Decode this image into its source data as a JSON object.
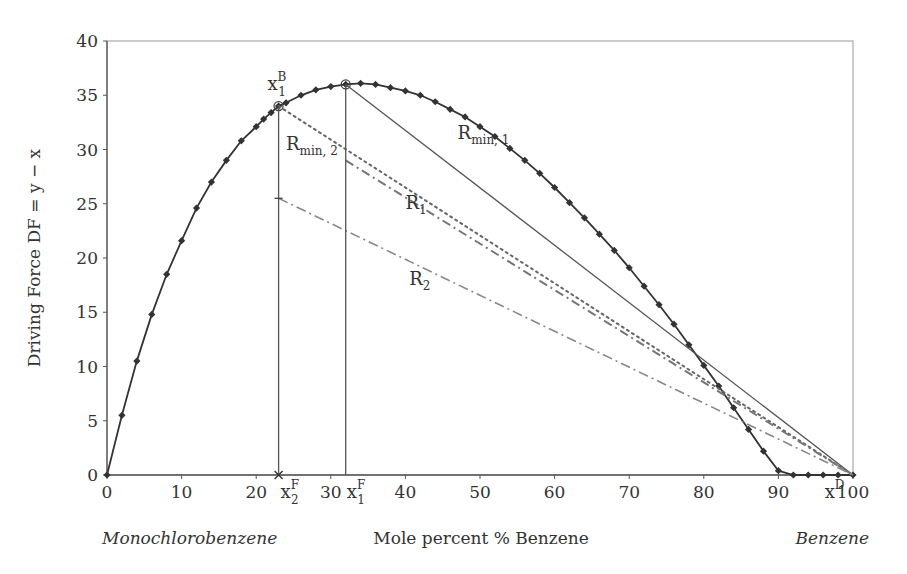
{
  "chart_data": {
    "type": "line",
    "title": "",
    "xlabel": "Mole percent % Benzene",
    "ylabel": "Driving Force DF = y − x",
    "xlim": [
      0,
      100
    ],
    "ylim": [
      0,
      40
    ],
    "x_ticks": [
      0,
      10,
      20,
      30,
      40,
      50,
      60,
      70,
      80,
      90,
      100
    ],
    "y_ticks": [
      0,
      5,
      10,
      15,
      20,
      25,
      30,
      35,
      40
    ],
    "grid": false,
    "legend": "none",
    "end_labels": {
      "left": "Monochlorobenzene",
      "right": "Benzene"
    },
    "series": [
      {
        "name": "Driving force curve",
        "style": "solid-with-diamond-markers",
        "x": [
          0,
          2,
          4,
          6,
          8,
          10,
          12,
          14,
          16,
          18,
          20,
          21,
          22,
          23,
          24,
          26,
          28,
          30,
          32,
          34,
          36,
          38,
          40,
          42,
          44,
          46,
          48,
          50,
          52,
          54,
          56,
          58,
          60,
          62,
          64,
          66,
          68,
          70,
          72,
          74,
          76,
          78,
          80,
          82,
          84,
          86,
          88,
          90,
          92,
          94,
          96,
          98,
          100
        ],
        "y": [
          0,
          5.5,
          10.5,
          14.8,
          18.5,
          21.6,
          24.6,
          27.0,
          29.0,
          30.8,
          32.1,
          32.8,
          33.4,
          34.0,
          34.3,
          35.0,
          35.5,
          35.8,
          36.0,
          36.1,
          36.0,
          35.7,
          35.4,
          35.0,
          34.4,
          33.7,
          33.0,
          32.1,
          31.2,
          30.1,
          29.0,
          27.8,
          26.5,
          25.1,
          23.7,
          22.2,
          20.7,
          19.1,
          17.4,
          15.7,
          13.9,
          12.0,
          10.1,
          8.2,
          6.2,
          4.2,
          2.2,
          0.4,
          0,
          0,
          0,
          0,
          0
        ]
      },
      {
        "name": "R_min,1",
        "style": "solid",
        "x": [
          32,
          100
        ],
        "y": [
          36.0,
          0
        ]
      },
      {
        "name": "R_min,2",
        "style": "dotted",
        "x": [
          23,
          100
        ],
        "y": [
          34.0,
          0
        ]
      },
      {
        "name": "R_1",
        "style": "dashed",
        "x": [
          32,
          100
        ],
        "y": [
          29.0,
          0
        ]
      },
      {
        "name": "R_2",
        "style": "dash-dot",
        "x": [
          23,
          100
        ],
        "y": [
          25.5,
          0
        ]
      },
      {
        "name": "x1F vertical",
        "style": "solid",
        "x": [
          32,
          32
        ],
        "y": [
          0,
          36.0
        ]
      },
      {
        "name": "x2F vertical",
        "style": "solid",
        "x": [
          23,
          23
        ],
        "y": [
          0,
          34.0
        ]
      }
    ],
    "annotations": [
      {
        "text": "x1B",
        "main": "x",
        "sup": "B",
        "sub": "1",
        "x": 21.5,
        "y": 35.5
      },
      {
        "text": "Rmin,2",
        "main": "R",
        "sub": "min, 2",
        "x": 24,
        "y": 30
      },
      {
        "text": "Rmin,1",
        "main": "R",
        "sub": "min, 1",
        "x": 47,
        "y": 31
      },
      {
        "text": "R1",
        "main": "R",
        "sub": "1",
        "x": 40,
        "y": 24.5
      },
      {
        "text": "R2",
        "main": "R",
        "sub": "2",
        "x": 40.5,
        "y": 17.5
      },
      {
        "text": "x2F",
        "main": "x",
        "sup": "F",
        "sub": "2",
        "x": 23,
        "y": -1.5
      },
      {
        "text": "x1F",
        "main": "x",
        "sup": "F",
        "sub": "1",
        "x": 32,
        "y": -1.5
      },
      {
        "text": "xD",
        "main": "x",
        "sup": "D",
        "x": 97,
        "y": -1.5
      }
    ]
  },
  "labels": {
    "xlabel": "Mole percent % Benzene",
    "ylabel": "Driving Force DF = y − x",
    "left_end": "Monochlorobenzene",
    "right_end": "Benzene"
  }
}
